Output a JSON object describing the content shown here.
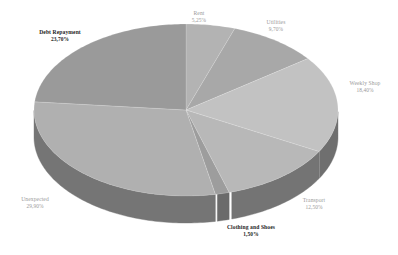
{
  "chart_data": {
    "type": "pie",
    "title": "",
    "subtitle": "",
    "xlabel": "",
    "ylabel": "",
    "grid": false,
    "legend": "none",
    "three_d": true,
    "label_format": "name + percent",
    "categories": [
      "Rent",
      "Utilities",
      "Weekly Shop",
      "Transport",
      "Clothing and Shoes",
      "Unexpected",
      "Debt Repayment"
    ],
    "values": [
      5.25,
      9.7,
      18.4,
      12.5,
      1.5,
      29.9,
      23.7
    ],
    "slices": [
      {
        "label": "Rent",
        "value": "5,25%",
        "percent": 5.25,
        "top_color": "#b3b3b3",
        "side_color": "#8f8f8f",
        "label_style": "faint"
      },
      {
        "label": "Utilities",
        "value": "9,70%",
        "percent": 9.7,
        "top_color": "#a8a8a8",
        "side_color": "#868686",
        "label_style": "faint"
      },
      {
        "label": "Weekly Shop",
        "value": "18,40%",
        "percent": 18.4,
        "top_color": "#c2c2c2",
        "side_color": "#6f6f6f",
        "label_style": "faint"
      },
      {
        "label": "Transport",
        "value": "12,50%",
        "percent": 12.5,
        "top_color": "#b8b8b8",
        "side_color": "#747474",
        "label_style": "faint"
      },
      {
        "label": "Clothing and Shoes",
        "value": "1,50%",
        "percent": 1.5,
        "top_color": "#9d9d9d",
        "side_color": "#6b6b6b",
        "label_style": "emph"
      },
      {
        "label": "Unexpected",
        "value": "29,90%",
        "percent": 29.9,
        "top_color": "#b0b0b0",
        "side_color": "#757575",
        "label_style": "faint"
      },
      {
        "label": "Debt Repayment",
        "value": "23,70%",
        "percent": 23.7,
        "top_color": "#9a9a9a",
        "side_color": "#7b7b7b",
        "label_style": "emph"
      }
    ],
    "background_color": "#ffffff",
    "emph_text_color": "#1d1d1d",
    "faint_text_color": "#9a9a9a"
  }
}
